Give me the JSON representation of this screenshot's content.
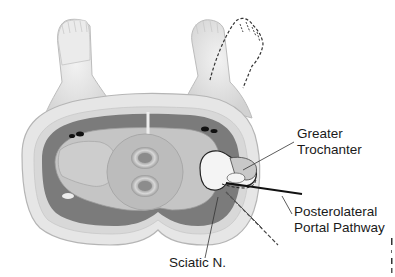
{
  "figure": {
    "colors": {
      "skin": "#e6e6e6",
      "skin_outline": "#b5b5b5",
      "fat_layer": "#dcdcdc",
      "muscle": "#7b7b7b",
      "bone_fill": "#c8c8c8",
      "femoral_head": "#f4f4f4",
      "pathway_line": "#111111",
      "label_text": "#1a1a1a"
    }
  },
  "labels": {
    "greater_trochanter": {
      "line1": "Greater",
      "line2": "Trochanter"
    },
    "posterolateral_portal": {
      "line1": "Posterolateral",
      "line2": "Portal Pathway"
    },
    "sciatic_nerve": {
      "line1": "Sciatic N."
    }
  }
}
